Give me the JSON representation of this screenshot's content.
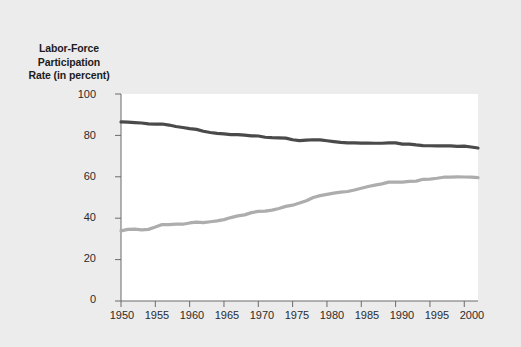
{
  "chart_data": {
    "type": "line",
    "title": "Labor-Force Participation Rate (in percent)",
    "title_lines": [
      "Labor-Force",
      "Participation",
      "Rate (in percent)"
    ],
    "xlabel": "",
    "ylabel": "Labor-Force Participation Rate (in percent)",
    "xlim": [
      1950,
      2002
    ],
    "ylim": [
      0,
      100
    ],
    "grid": false,
    "legend_position": "inline-annotations",
    "yticks": [
      0,
      20,
      40,
      60,
      80,
      100
    ],
    "ytick_labels": [
      "0",
      "20",
      "40",
      "60",
      "80",
      "100"
    ],
    "xticks": [
      1950,
      1955,
      1960,
      1965,
      1970,
      1975,
      1980,
      1985,
      1990,
      1995,
      2000
    ],
    "xtick_labels": [
      "1950",
      "1955",
      "1960",
      "1965",
      "1970",
      "1975",
      "1980",
      "1985",
      "1990",
      "1995",
      "2000"
    ],
    "x": [
      1950,
      1951,
      1952,
      1953,
      1954,
      1955,
      1956,
      1957,
      1958,
      1959,
      1960,
      1961,
      1962,
      1963,
      1964,
      1965,
      1966,
      1967,
      1968,
      1969,
      1970,
      1971,
      1972,
      1973,
      1974,
      1975,
      1976,
      1977,
      1978,
      1979,
      1980,
      1981,
      1982,
      1983,
      1984,
      1985,
      1986,
      1987,
      1988,
      1989,
      1990,
      1991,
      1992,
      1993,
      1994,
      1995,
      1996,
      1997,
      1998,
      1999,
      2000,
      2001,
      2002
    ],
    "series": [
      {
        "name": "Men",
        "color": "#4a4a4a",
        "label_text": "Men",
        "values": [
          86.5,
          86.4,
          86.2,
          86.0,
          85.6,
          85.4,
          85.5,
          85.0,
          84.3,
          83.8,
          83.3,
          82.9,
          82.0,
          81.4,
          81.0,
          80.7,
          80.4,
          80.4,
          80.1,
          79.8,
          79.7,
          79.1,
          78.9,
          78.8,
          78.7,
          77.9,
          77.5,
          77.7,
          77.9,
          77.8,
          77.4,
          77.0,
          76.6,
          76.4,
          76.4,
          76.3,
          76.3,
          76.2,
          76.2,
          76.4,
          76.4,
          75.8,
          75.8,
          75.4,
          75.1,
          75.0,
          74.9,
          75.0,
          74.9,
          74.7,
          74.8,
          74.4,
          73.9
        ]
      },
      {
        "name": "Women",
        "color": "#adadad",
        "label_text": "Women",
        "values": [
          33.9,
          34.6,
          34.7,
          34.4,
          34.6,
          35.7,
          36.9,
          36.9,
          37.1,
          37.1,
          37.7,
          38.1,
          37.9,
          38.3,
          38.7,
          39.3,
          40.3,
          41.1,
          41.6,
          42.7,
          43.3,
          43.4,
          43.9,
          44.7,
          45.7,
          46.3,
          47.3,
          48.4,
          50.0,
          50.9,
          51.5,
          52.1,
          52.6,
          52.9,
          53.6,
          54.5,
          55.3,
          56.0,
          56.6,
          57.4,
          57.5,
          57.4,
          57.8,
          57.9,
          58.8,
          58.9,
          59.3,
          59.8,
          59.8,
          60.0,
          59.9,
          59.8,
          59.6
        ]
      }
    ],
    "annotations": [
      {
        "text": "Men",
        "x": 1971,
        "y": 84
      },
      {
        "text": "Women",
        "x": 1970,
        "y": 41
      }
    ]
  }
}
